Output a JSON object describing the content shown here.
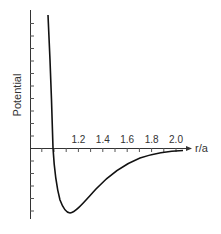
{
  "chart_data": {
    "type": "line",
    "title": "",
    "xlabel": "r/a",
    "ylabel": "Potential",
    "x_ticks": [
      1.2,
      1.4,
      1.6,
      1.8,
      2.0
    ],
    "x_tick_labels": [
      "1.2",
      "1.4",
      "1.6",
      "1.8",
      "2.0"
    ],
    "x_minor_tick_step": 0.1,
    "xlim": [
      0.8,
      2.1
    ],
    "y_tick_labels": [],
    "y_tick_count_above_axis": 10,
    "y_tick_count_below_axis": 5,
    "grid": false,
    "legend": null,
    "series": [
      {
        "name": "Potential",
        "description": "Lennard-Jones-like pair potential: steep repulsive wall, zero crossing near r/a = 1.0, minimum near r/a ≈ 1.12, asymptotically approaching zero from below",
        "x": [
          0.96,
          0.98,
          1.0,
          1.01,
          1.03,
          1.07,
          1.12,
          1.2,
          1.3,
          1.4,
          1.5,
          1.6,
          1.7,
          1.8,
          1.9,
          2.05
        ],
        "y": [
          10.7,
          5.5,
          0.0,
          -1.8,
          -3.4,
          -4.6,
          -5.1,
          -4.5,
          -3.1,
          -2.1,
          -1.4,
          -0.9,
          -0.6,
          -0.35,
          -0.2,
          -0.1
        ]
      }
    ]
  },
  "axes": {
    "x_label": "r/a",
    "y_label": "Potential",
    "x_tick_labels": [
      "1.2",
      "1.4",
      "1.6",
      "1.8",
      "2.0"
    ]
  }
}
